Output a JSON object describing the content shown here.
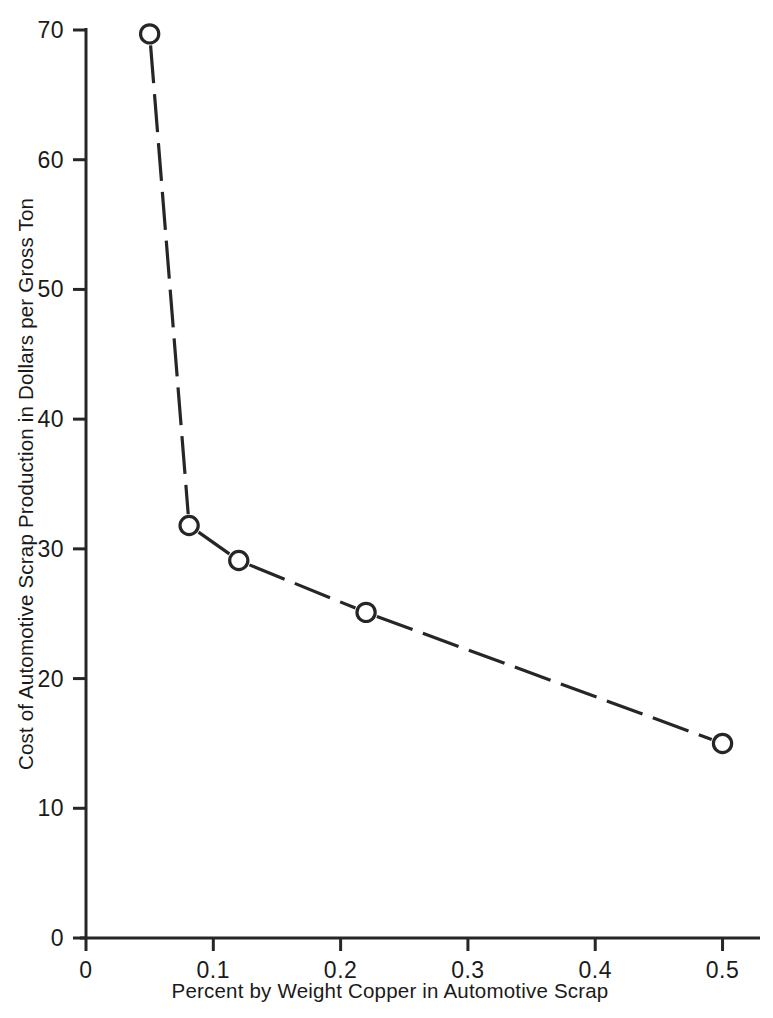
{
  "chart_data": {
    "type": "line",
    "title": "",
    "xlabel": "Percent by Weight Copper in Automotive Scrap",
    "ylabel": "Cost of Automotive Scrap Production in Dollars per Gross Ton",
    "xlim": [
      0,
      0.52
    ],
    "ylim": [
      0,
      70
    ],
    "xticks": [
      "0",
      "0.1",
      "0.2",
      "0.3",
      "0.4",
      "0.5"
    ],
    "xtick_values": [
      0,
      0.1,
      0.2,
      0.3,
      0.4,
      0.5
    ],
    "yticks": [
      "0",
      "10",
      "20",
      "30",
      "40",
      "50",
      "60",
      "70"
    ],
    "ytick_values": [
      0,
      10,
      20,
      30,
      40,
      50,
      60,
      70
    ],
    "grid": false,
    "legend": "none",
    "line_style": "dashed",
    "marker": "open-circle",
    "line_color": "#262626",
    "marker_fill": "#ffffff",
    "background": "#ffffff",
    "x": [
      0.05,
      0.081,
      0.12,
      0.22,
      0.5
    ],
    "y": [
      69.7,
      31.8,
      29.1,
      25.1,
      15.0
    ],
    "points": [
      {
        "x": 0.05,
        "y": 69.7
      },
      {
        "x": 0.081,
        "y": 31.8
      },
      {
        "x": 0.12,
        "y": 29.1
      },
      {
        "x": 0.22,
        "y": 25.1
      },
      {
        "x": 0.5,
        "y": 15.0
      }
    ]
  }
}
